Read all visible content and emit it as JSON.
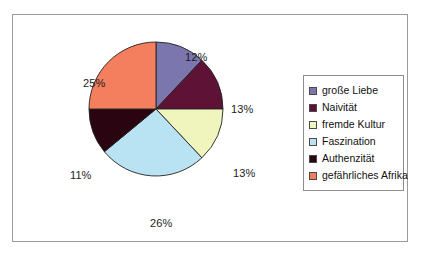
{
  "chart_data": {
    "type": "pie",
    "title": "",
    "categories": [
      "große Liebe",
      "Naivität",
      "fremde Kultur",
      "Faszination",
      "Authenzität",
      "gefährliches Afrika"
    ],
    "values": [
      12,
      13,
      13,
      26,
      11,
      25
    ],
    "value_labels": [
      "12%",
      "13%",
      "13%",
      "26%",
      "11%",
      "25%"
    ],
    "unit": "%",
    "colors": [
      "#7b76ad",
      "#5e1236",
      "#eff5bd",
      "#b9e2f2",
      "#2a0411",
      "#f47f5f"
    ],
    "legend_position": "right",
    "grid": false,
    "start_angle_deg": 0,
    "direction": "clockwise"
  },
  "legend": {
    "items": [
      {
        "label": "große Liebe",
        "color": "#7b76ad"
      },
      {
        "label": "Naivität",
        "color": "#5e1236"
      },
      {
        "label": "fremde Kultur",
        "color": "#eff5bd"
      },
      {
        "label": "Faszination",
        "color": "#b9e2f2"
      },
      {
        "label": "Authenzität",
        "color": "#2a0411"
      },
      {
        "label": "gefährliches Afrika",
        "color": "#f47f5f"
      }
    ]
  },
  "pie_labels": [
    {
      "text": "12%",
      "x": 172,
      "y": 36
    },
    {
      "text": "13%",
      "x": 218,
      "y": 88
    },
    {
      "text": "13%",
      "x": 220,
      "y": 152
    },
    {
      "text": "26%",
      "x": 137,
      "y": 202
    },
    {
      "text": "11%",
      "x": 57,
      "y": 154
    },
    {
      "text": "25%",
      "x": 70,
      "y": 62
    }
  ],
  "style": {
    "frame_border": "#9a9a9a",
    "background": "#ffffff",
    "slice_outline": "#23221f",
    "text_color": "#1c1c1c"
  }
}
